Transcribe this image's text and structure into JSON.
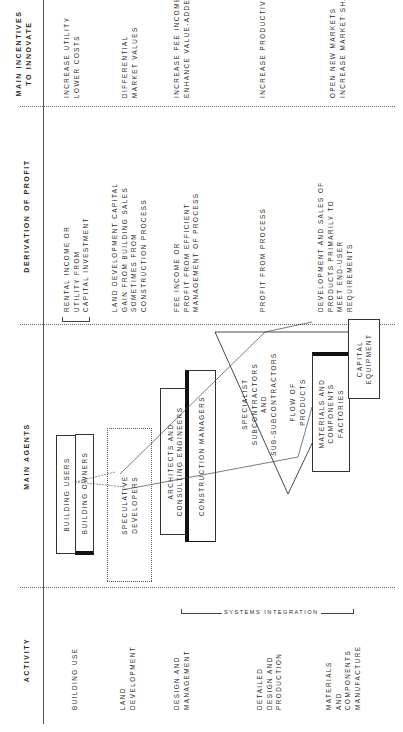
{
  "columns": {
    "activity": "ACTIVITY",
    "main_agents": "MAIN AGENTS",
    "derivation_of_profit": "DERIVATION OF PROFIT",
    "main_incentives": "MAIN INCENTIVES\nTO INNOVATE"
  },
  "activities": [
    "BUILDING USE",
    "LAND\nDEVELOPMENT",
    "DESIGN AND\nMANAGEMENT",
    "DETAILED\nDESIGN AND\nPRODUCTION",
    "MATERIALS\nAND\nCOMPONENTS\nMANUFACTURE"
  ],
  "systems_integration_label": "SYSTEMS INTEGRATION",
  "agents": {
    "building_users": "BUILDING USERS",
    "building_owners": "BUILDING OWNERS",
    "speculative_developers": "SPECULATIVE\nDEVELOPERS",
    "architects": "ARCHITECTS AND\nCONSULTING ENGINEERS",
    "construction_managers": "CONSTRUCTION MANAGERS",
    "specialist_subcontractors": "SPECIALIST\nSUBCONTRACTORS\nAND\nSUB-SUBCONTRACTORS",
    "flow_of_products": "FLOW OF\nPRODUCTS",
    "materials_factories": "MATERIALS AND\nCOMPONENTS\nFACTORIES",
    "capital_equipment": "CAPITAL\nEQUIPMENT"
  },
  "derivation_of_profit": [
    "RENTAL INCOME OR\nUTILITY FROM\nCAPITAL INVESTMENT",
    "LAND DEVELOPMENT CAPITAL\nGAIN FROM BUILDING SALES\nSOMETIMES FROM\nCONSTRUCTION PROCESS",
    "FEE INCOME OR\nPROFIT FROM EFFICIENT\nMANAGEMENT OF PROCESS",
    "PROFIT FROM PROCESS",
    "DEVELOPMENT AND SALES OF\nPRODUCTS PRIMARILY TO\nMEET END-USER\nREQUIREMENTS"
  ],
  "main_incentives": [
    "INCREASE UTILITY\nLOWER COSTS",
    "DIFFERENTIAL\nMARKET VALUES",
    "INCREASE FEE INCOME\nENHANCE VALUE-ADDED",
    "INCREASE PRODUCTIVITY",
    "OPEN NEW MARKETS\nINCREASE MARKET SHARE"
  ]
}
